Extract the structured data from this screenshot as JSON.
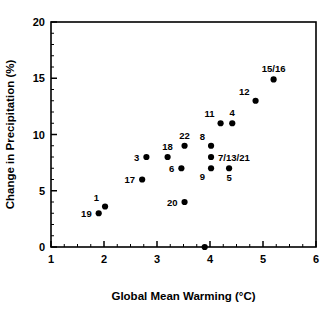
{
  "chart_data": {
    "type": "scatter",
    "title": "",
    "xlabel": "Global Mean Warming (°C)",
    "ylabel": "Change in Precipitation (%)",
    "xlim": [
      1,
      6
    ],
    "ylim": [
      0,
      20
    ],
    "xticks": [
      1,
      2,
      3,
      4,
      5,
      6
    ],
    "xtick_labels": [
      "1",
      "2",
      "3",
      "4",
      "5",
      "6"
    ],
    "yticks": [
      0,
      5,
      10,
      15,
      20
    ],
    "ytick_labels": [
      "0",
      "5",
      "10",
      "15",
      "20"
    ],
    "x_minor_tick_step": 0.25,
    "y_minor_tick_step": 1,
    "grid": false,
    "legend": null,
    "marker": "filled-circle",
    "marker_color": "#000000",
    "points": [
      {
        "label": "19",
        "x": 1.9,
        "y": 3.0,
        "label_pos": "left"
      },
      {
        "label": "1",
        "x": 2.02,
        "y": 3.6,
        "label_pos": "above-left"
      },
      {
        "label": "17",
        "x": 2.72,
        "y": 6.0,
        "label_pos": "left"
      },
      {
        "label": "3",
        "x": 2.8,
        "y": 8.0,
        "label_pos": "left"
      },
      {
        "label": "18",
        "x": 3.2,
        "y": 8.0,
        "label_pos": "above"
      },
      {
        "label": "6",
        "x": 3.46,
        "y": 7.0,
        "label_pos": "left"
      },
      {
        "label": "20",
        "x": 3.52,
        "y": 4.0,
        "label_pos": "left"
      },
      {
        "label": "22",
        "x": 3.52,
        "y": 9.0,
        "label_pos": "above"
      },
      {
        "label": "",
        "x": 3.9,
        "y": 0.0,
        "label_pos": "none"
      },
      {
        "label": "8",
        "x": 4.02,
        "y": 9.0,
        "label_pos": "above-left"
      },
      {
        "label": "7/13/21",
        "x": 4.02,
        "y": 8.0,
        "label_pos": "right"
      },
      {
        "label": "9",
        "x": 4.02,
        "y": 7.0,
        "label_pos": "below-left"
      },
      {
        "label": "5",
        "x": 4.36,
        "y": 7.0,
        "label_pos": "below"
      },
      {
        "label": "11",
        "x": 4.2,
        "y": 11.0,
        "label_pos": "above-left"
      },
      {
        "label": "4",
        "x": 4.42,
        "y": 11.0,
        "label_pos": "above"
      },
      {
        "label": "12",
        "x": 4.86,
        "y": 13.0,
        "label_pos": "above-left"
      },
      {
        "label": "15/16",
        "x": 5.2,
        "y": 14.9,
        "label_pos": "above"
      }
    ]
  }
}
